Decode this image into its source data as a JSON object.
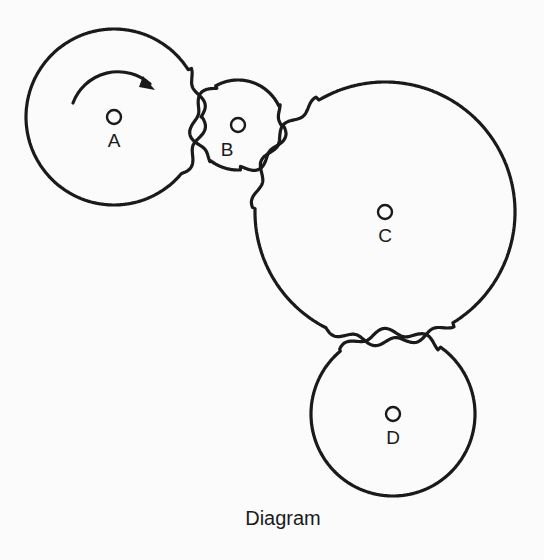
{
  "caption": "Diagram",
  "gears": [
    {
      "id": "A",
      "label": "A",
      "cx": 114,
      "cy": 117,
      "r": 88,
      "rotation_arrow": "clockwise"
    },
    {
      "id": "B",
      "label": "B",
      "cx": 238,
      "cy": 125,
      "r": 45
    },
    {
      "id": "C",
      "label": "C",
      "cx": 385,
      "cy": 212,
      "r": 130
    },
    {
      "id": "D",
      "label": "D",
      "cx": 393,
      "cy": 414,
      "r": 82
    }
  ],
  "meshes": [
    [
      "A",
      "B"
    ],
    [
      "B",
      "C"
    ],
    [
      "C",
      "D"
    ]
  ],
  "colors": {
    "stroke": "#1a1a1a",
    "background": "#fbfbfb"
  }
}
